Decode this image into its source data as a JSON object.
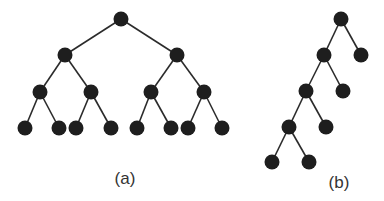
{
  "figure": {
    "width": 384,
    "height": 201,
    "node_radius": 7.5,
    "node_color": "#1e1e1e",
    "edge_color": "#2b2b2b"
  },
  "trees": [
    {
      "id": "a",
      "label": "(a)",
      "label_pos": [
        125,
        184
      ],
      "description": "Complete balanced binary tree, depth 3, 15 nodes",
      "nodes": [
        {
          "id": "a0",
          "x": 121,
          "y": 19
        },
        {
          "id": "a1",
          "x": 65,
          "y": 55
        },
        {
          "id": "a2",
          "x": 177,
          "y": 55
        },
        {
          "id": "a3",
          "x": 40,
          "y": 92
        },
        {
          "id": "a4",
          "x": 91,
          "y": 92
        },
        {
          "id": "a5",
          "x": 151,
          "y": 92
        },
        {
          "id": "a6",
          "x": 204,
          "y": 92
        },
        {
          "id": "a7",
          "x": 25,
          "y": 128
        },
        {
          "id": "a8",
          "x": 59,
          "y": 128
        },
        {
          "id": "a9",
          "x": 76,
          "y": 128
        },
        {
          "id": "a10",
          "x": 111,
          "y": 128
        },
        {
          "id": "a11",
          "x": 137,
          "y": 128
        },
        {
          "id": "a12",
          "x": 171,
          "y": 128
        },
        {
          "id": "a13",
          "x": 188,
          "y": 128
        },
        {
          "id": "a14",
          "x": 222,
          "y": 128
        }
      ],
      "edges": [
        [
          "a0",
          "a1"
        ],
        [
          "a0",
          "a2"
        ],
        [
          "a1",
          "a3"
        ],
        [
          "a1",
          "a4"
        ],
        [
          "a2",
          "a5"
        ],
        [
          "a2",
          "a6"
        ],
        [
          "a3",
          "a7"
        ],
        [
          "a3",
          "a8"
        ],
        [
          "a4",
          "a9"
        ],
        [
          "a4",
          "a10"
        ],
        [
          "a5",
          "a11"
        ],
        [
          "a5",
          "a12"
        ],
        [
          "a6",
          "a13"
        ],
        [
          "a6",
          "a14"
        ]
      ]
    },
    {
      "id": "b",
      "label": "(b)",
      "label_pos": [
        339,
        188
      ],
      "description": "Degenerate left-leaning binary tree, 9 nodes",
      "nodes": [
        {
          "id": "b0",
          "x": 341,
          "y": 19
        },
        {
          "id": "b1",
          "x": 324,
          "y": 55
        },
        {
          "id": "b2",
          "x": 361,
          "y": 55
        },
        {
          "id": "b3",
          "x": 306,
          "y": 91
        },
        {
          "id": "b4",
          "x": 343,
          "y": 91
        },
        {
          "id": "b5",
          "x": 289,
          "y": 127
        },
        {
          "id": "b6",
          "x": 326,
          "y": 127
        },
        {
          "id": "b7",
          "x": 272,
          "y": 162
        },
        {
          "id": "b8",
          "x": 309,
          "y": 162
        }
      ],
      "edges": [
        [
          "b0",
          "b1"
        ],
        [
          "b0",
          "b2"
        ],
        [
          "b1",
          "b3"
        ],
        [
          "b1",
          "b4"
        ],
        [
          "b3",
          "b5"
        ],
        [
          "b3",
          "b6"
        ],
        [
          "b5",
          "b7"
        ],
        [
          "b5",
          "b8"
        ]
      ]
    }
  ]
}
